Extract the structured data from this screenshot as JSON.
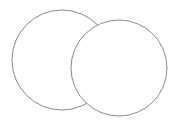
{
  "diagram": {
    "type": "overlapping-circles",
    "background": "#ffffff",
    "stroke_color": "#8a8a8a",
    "fill_color": "#ffffff",
    "circles": [
      {
        "cx": 62,
        "cy": 60,
        "r": 50
      },
      {
        "cx": 119,
        "cy": 68,
        "r": 48
      }
    ]
  }
}
